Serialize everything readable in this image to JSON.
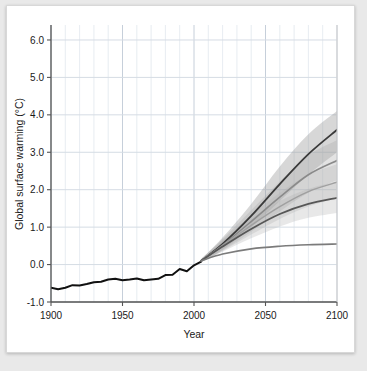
{
  "chart_data": {
    "type": "line",
    "title": "",
    "xlabel": "Year",
    "ylabel": "Global surface warming (°C)",
    "xlim": [
      1900,
      2100
    ],
    "ylim": [
      -1.0,
      6.4
    ],
    "xticks": [
      1900,
      1950,
      2000,
      2050,
      2100
    ],
    "xtick_labels": [
      "1900",
      "1950",
      "2000",
      "2050",
      "2100"
    ],
    "yticks": [
      -1.0,
      0.0,
      1.0,
      2.0,
      3.0,
      4.0,
      5.0,
      6.0
    ],
    "ytick_labels": [
      "-1.0",
      "0.0",
      "1.0",
      "2.0",
      "3.0",
      "4.0",
      "5.0",
      "6.0"
    ],
    "grid": true,
    "grid_minor_x_step": 10,
    "legend": "none",
    "series": [
      {
        "name": "historical-observations",
        "color": "#111111",
        "width": 2.0,
        "x": [
          1900,
          1905,
          1910,
          1915,
          1920,
          1925,
          1930,
          1935,
          1940,
          1945,
          1950,
          1955,
          1960,
          1965,
          1970,
          1975,
          1980,
          1985,
          1990,
          1995,
          2000,
          2005
        ],
        "values": [
          -0.62,
          -0.66,
          -0.62,
          -0.55,
          -0.56,
          -0.52,
          -0.47,
          -0.46,
          -0.4,
          -0.38,
          -0.42,
          -0.4,
          -0.37,
          -0.42,
          -0.4,
          -0.38,
          -0.28,
          -0.27,
          -0.12,
          -0.18,
          -0.02,
          0.08
        ]
      },
      {
        "name": "scenario-high",
        "color": "#3a3a3a",
        "width": 1.8,
        "x": [
          2005,
          2020,
          2040,
          2060,
          2080,
          2100
        ],
        "values": [
          0.1,
          0.55,
          1.3,
          2.15,
          2.95,
          3.6
        ],
        "band_low": [
          0.06,
          0.4,
          1.0,
          1.7,
          2.4,
          3.0
        ],
        "band_high": [
          0.14,
          0.72,
          1.62,
          2.62,
          3.48,
          4.1
        ],
        "band_color": "#9a9a9a",
        "band_opacity": 0.4
      },
      {
        "name": "scenario-mid-high",
        "color": "#8a8a8a",
        "width": 1.6,
        "x": [
          2005,
          2020,
          2040,
          2060,
          2080,
          2100
        ],
        "values": [
          0.1,
          0.52,
          1.15,
          1.8,
          2.4,
          2.78
        ],
        "band_low": [
          0.06,
          0.38,
          0.88,
          1.42,
          1.92,
          2.25
        ],
        "band_high": [
          0.14,
          0.68,
          1.45,
          2.22,
          2.92,
          3.32
        ],
        "band_color": "#a8a8a8",
        "band_opacity": 0.32
      },
      {
        "name": "scenario-mid",
        "color": "#a0a0a0",
        "width": 1.5,
        "x": [
          2005,
          2020,
          2040,
          2060,
          2080,
          2100
        ],
        "values": [
          0.1,
          0.5,
          1.05,
          1.55,
          1.95,
          2.2
        ],
        "band_low": [
          0.06,
          0.36,
          0.8,
          1.22,
          1.55,
          1.78
        ],
        "band_high": [
          0.14,
          0.66,
          1.32,
          1.92,
          2.4,
          2.68
        ],
        "band_color": "#b4b4b4",
        "band_opacity": 0.3
      },
      {
        "name": "scenario-low",
        "color": "#575757",
        "width": 1.8,
        "x": [
          2005,
          2020,
          2040,
          2060,
          2080,
          2100
        ],
        "values": [
          0.1,
          0.48,
          0.95,
          1.35,
          1.62,
          1.78
        ],
        "band_low": [
          0.06,
          0.34,
          0.7,
          1.02,
          1.25,
          1.38
        ],
        "band_high": [
          0.14,
          0.63,
          1.21,
          1.7,
          2.02,
          2.22
        ],
        "band_color": "#adadad",
        "band_opacity": 0.28
      },
      {
        "name": "scenario-constant-composition",
        "color": "#7b7b7b",
        "width": 1.6,
        "x": [
          2005,
          2020,
          2040,
          2060,
          2080,
          2100
        ],
        "values": [
          0.1,
          0.28,
          0.42,
          0.49,
          0.53,
          0.55
        ],
        "band_low": null,
        "band_high": null
      }
    ]
  },
  "axis": {
    "ylabel": "Global surface warming (°C)",
    "xlabel": "Year",
    "ytick_labels": [
      "6.0",
      "5.0",
      "4.0",
      "3.0",
      "2.0",
      "1.0",
      "0.0",
      "-1.0"
    ],
    "xtick_labels": [
      "1900",
      "1950",
      "2000",
      "2050",
      "2100"
    ]
  },
  "colors": {
    "frame": "#555555",
    "grid": "#d5dce4",
    "background": "#ffffff",
    "page_background": "#e9e9e9",
    "historical": "#111111"
  }
}
